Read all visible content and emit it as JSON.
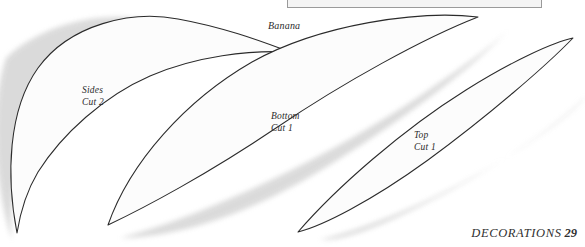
{
  "page": {
    "width": 585,
    "height": 247,
    "background": "#ffffff",
    "ink_color": "#2b2b2b",
    "shadow_color": "#d9d9d9",
    "fill_color": "#fcfcfc"
  },
  "top_box": {
    "name": "cropped-panel",
    "border_color": "#9a9a9a",
    "fill": "#f4f4f4"
  },
  "title": {
    "banana": "Banana"
  },
  "pattern_pieces": [
    {
      "id": "sides",
      "name": "Sides",
      "cut": "Cut 2",
      "label_x": 82,
      "label_y": 84
    },
    {
      "id": "bottom",
      "name": "Bottom",
      "cut": "Cut 1",
      "label_x": 271,
      "label_y": 110
    },
    {
      "id": "top",
      "name": "Top",
      "cut": "Cut 1",
      "label_x": 414,
      "label_y": 129
    }
  ],
  "footer": {
    "section": "DECORATIONS",
    "page_number": "29"
  }
}
